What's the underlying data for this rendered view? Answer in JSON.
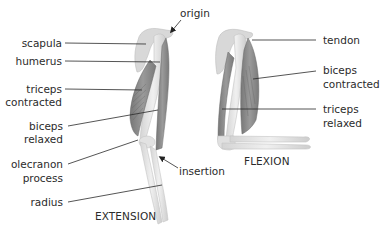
{
  "diagram": {
    "type": "anatomical-labeled-illustration",
    "panels": [
      {
        "id": "extension",
        "caption": "EXTENSION",
        "labels": {
          "origin": "origin",
          "scapula": "scapula",
          "humerus": "humerus",
          "triceps_contracted_1": "triceps",
          "triceps_contracted_2": "contracted",
          "biceps_relaxed_1": "biceps",
          "biceps_relaxed_2": "relaxed",
          "olecranon_1": "olecranon",
          "olecranon_2": "process",
          "insertion": "insertion",
          "radius": "radius"
        }
      },
      {
        "id": "flexion",
        "caption": "FLEXION",
        "labels": {
          "tendon": "tendon",
          "biceps_contracted_1": "biceps",
          "biceps_contracted_2": "contracted",
          "triceps_relaxed_1": "triceps",
          "triceps_relaxed_2": "relaxed"
        }
      }
    ],
    "colors": {
      "bone": "#e6e6e6",
      "bone_shade": "#cfcfcf",
      "muscle": "#8f8f8f",
      "muscle_dark": "#6f6f6f",
      "leader_line": "#2a2a2a",
      "text": "#2b2b2b"
    }
  }
}
